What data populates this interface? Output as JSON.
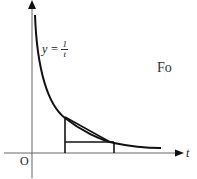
{
  "diagram": {
    "function_label": "y = 1/t",
    "function_lhs": "y =",
    "function_num": "1",
    "function_den": "t",
    "x_axis_label": "t",
    "origin_label": "O",
    "side_text": "Fo"
  },
  "colors": {
    "stroke": "#111111",
    "axis": "#555555"
  }
}
